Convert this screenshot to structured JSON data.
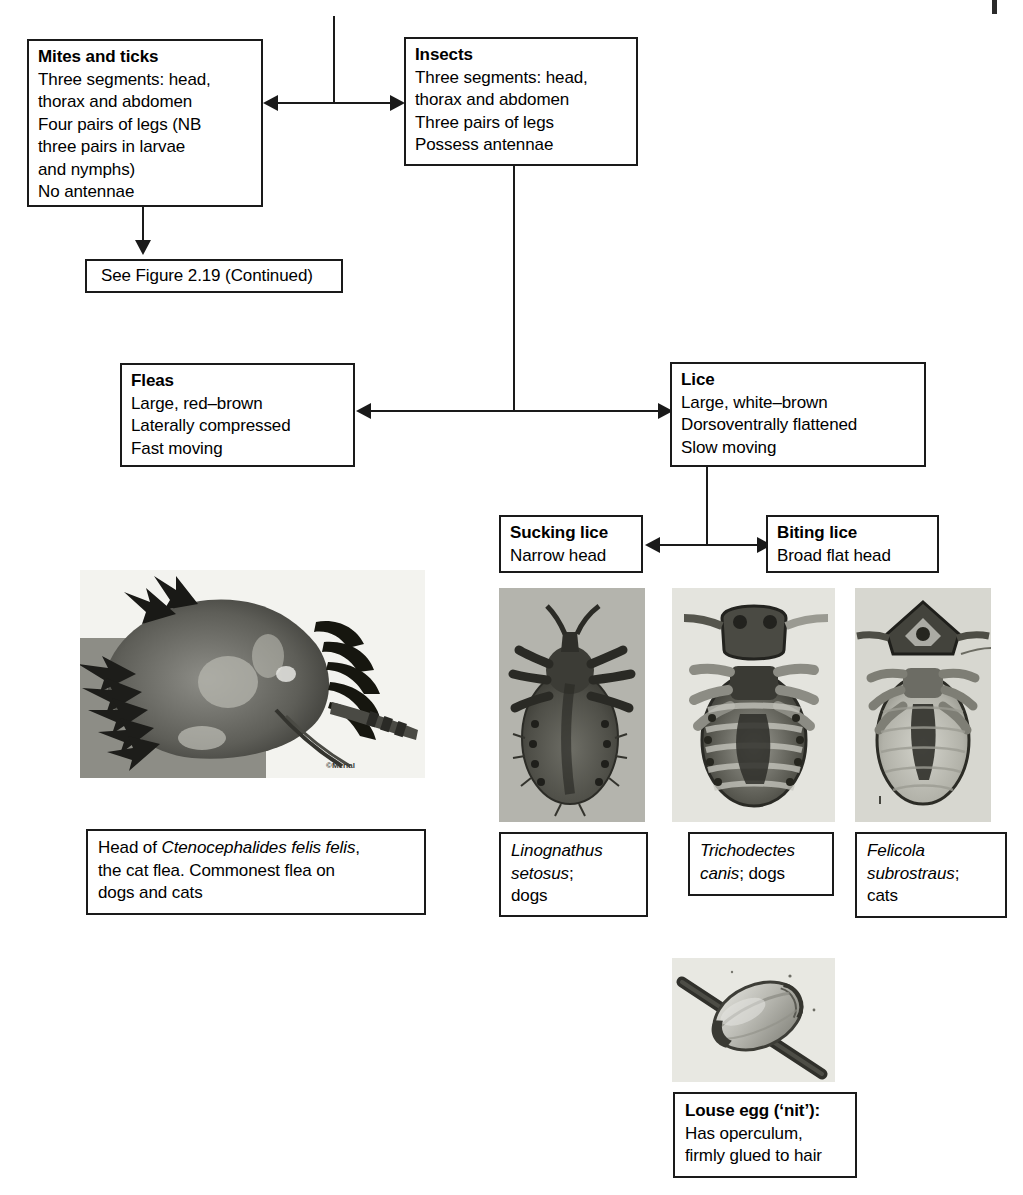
{
  "figure": {
    "ink_color": "#1a1a1a",
    "page_background": "#ffffff"
  },
  "nodes": {
    "mites_ticks": {
      "heading": "Mites and ticks",
      "lines": [
        "Three segments: head,",
        "thorax and abdomen",
        "Four pairs of legs (NB",
        "three pairs in larvae",
        "and nymphs)",
        "No antennae"
      ]
    },
    "insects": {
      "heading": "Insects",
      "lines": [
        "Three segments: head,",
        "thorax and abdomen",
        "Three pairs of legs",
        "Possess antennae"
      ]
    },
    "see_figure": {
      "text": "See Figure 2.19 (Continued)"
    },
    "fleas": {
      "heading": "Fleas",
      "lines": [
        "Large, red–brown",
        "Laterally compressed",
        "Fast moving"
      ]
    },
    "lice": {
      "heading": "Lice",
      "lines": [
        "Large, white–brown",
        "Dorsoventrally flattened",
        "Slow moving"
      ]
    },
    "sucking_lice": {
      "heading": "Sucking lice",
      "lines": [
        "Narrow head"
      ]
    },
    "biting_lice": {
      "heading": "Biting lice",
      "lines": [
        "Broad flat head"
      ]
    }
  },
  "captions": {
    "flea_head": {
      "lines": [
        {
          "pre": "Head of ",
          "italic": "Ctenocephalides felis felis",
          "post": ","
        },
        {
          "pre": "the cat flea. Commonest flea on",
          "italic": "",
          "post": ""
        },
        {
          "pre": "dogs and cats",
          "italic": "",
          "post": ""
        }
      ]
    },
    "linognathus": {
      "lines": [
        {
          "pre": "",
          "italic": "Linognathus",
          "post": ""
        },
        {
          "pre": "",
          "italic": "setosus",
          "post": ";"
        },
        {
          "pre": "dogs",
          "italic": "",
          "post": ""
        }
      ]
    },
    "trichodectes": {
      "lines": [
        {
          "pre": "",
          "italic": "Trichodectes",
          "post": ""
        },
        {
          "pre": "",
          "italic": "canis",
          "post": "; dogs"
        }
      ]
    },
    "felicola": {
      "lines": [
        {
          "pre": "",
          "italic": "Felicola",
          "post": ""
        },
        {
          "pre": "",
          "italic": "subrostraus",
          "post": ";"
        },
        {
          "pre": "cats",
          "italic": "",
          "post": ""
        }
      ]
    },
    "louse_egg": {
      "heading": "Louse egg (‘nit’):",
      "lines": [
        "Has operculum,",
        "firmly glued to hair"
      ]
    }
  },
  "photos": {
    "flea_head": {
      "name": "flea-head-micrograph",
      "watermark": "©Merial",
      "background": "#f2f2ee"
    },
    "linognathus": {
      "name": "linognathus-setosus-micrograph",
      "background": "#b0b0a8"
    },
    "trichodectes": {
      "name": "trichodectes-canis-micrograph",
      "background": "#e3e3dd"
    },
    "felicola": {
      "name": "felicola-subrostraus-micrograph",
      "background": "#d6d6cf"
    },
    "louse_egg": {
      "name": "louse-egg-nit-micrograph",
      "background": "#e6e6e0"
    }
  },
  "connectors": [
    {
      "name": "trunk-from-previous-page",
      "type": "vertical"
    },
    {
      "name": "mites-insects-split",
      "type": "bidirectional-horizontal"
    },
    {
      "name": "mites-to-see-figure",
      "type": "down-arrow"
    },
    {
      "name": "insects-to-flea-lice",
      "type": "vertical"
    },
    {
      "name": "fleas-lice-split",
      "type": "bidirectional-horizontal"
    },
    {
      "name": "lice-to-sucking-biting",
      "type": "vertical"
    },
    {
      "name": "sucking-biting-split",
      "type": "bidirectional-horizontal"
    }
  ]
}
